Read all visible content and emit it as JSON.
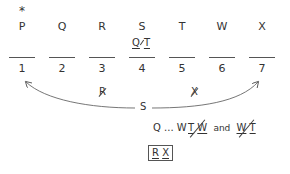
{
  "diagram": {
    "marker": "*",
    "letters": [
      "P",
      "Q",
      "R",
      "S",
      "T",
      "W",
      "X"
    ],
    "above_slot_4": {
      "left": "Q",
      "right": "T"
    },
    "slots": [
      "1",
      "2",
      "3",
      "4",
      "5",
      "6",
      "7"
    ],
    "excluded": [
      {
        "slot": "3",
        "letter": "R"
      },
      {
        "slot": "5",
        "letter": "X"
      }
    ],
    "arrow_label": "S",
    "rules": {
      "sequence": {
        "first": "Q",
        "ellipsis": "...",
        "last": "W"
      },
      "pair_a": {
        "left": "T",
        "right": "W"
      },
      "connector": "and",
      "pair_b": {
        "left": "W",
        "right": "T"
      },
      "block": {
        "left": "R",
        "right": "X"
      }
    }
  }
}
